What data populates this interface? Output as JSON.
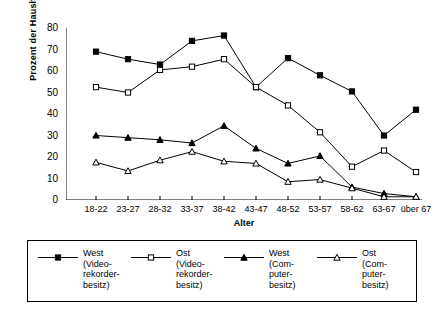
{
  "chart_data": {
    "type": "line",
    "title": "",
    "xlabel": "Alter",
    "ylabel": "Prozent der Haushalte",
    "categories": [
      "18-22",
      "23-27",
      "28-32",
      "33-37",
      "38-42",
      "43-47",
      "48-52",
      "53-57",
      "58-62",
      "63-67",
      "über 67"
    ],
    "ylim": [
      0,
      80
    ],
    "yticks": [
      0,
      10,
      20,
      30,
      40,
      50,
      60,
      70,
      80
    ],
    "grid": false,
    "legend_position": "bottom",
    "series": [
      {
        "name": "West (Videorekorderbesitz)",
        "marker": "filled-square",
        "values": [
          69,
          65.5,
          63,
          74,
          76.5,
          52.5,
          66,
          58,
          50.5,
          30,
          42
        ]
      },
      {
        "name": "Ost (Videorekorderbesitz)",
        "marker": "open-square",
        "values": [
          52.5,
          50,
          60.5,
          62,
          65.5,
          52.5,
          44,
          31.5,
          15.5,
          23,
          13
        ]
      },
      {
        "name": "West (Computerbesitz)",
        "marker": "filled-triangle",
        "values": [
          30,
          29,
          28,
          26.5,
          34.5,
          24,
          17,
          20.5,
          6,
          3,
          1.5
        ]
      },
      {
        "name": "Ost (Computerbesitz)",
        "marker": "open-triangle",
        "values": [
          17.5,
          13.5,
          18.5,
          22.5,
          18,
          17,
          8.5,
          9.5,
          5.5,
          1.5,
          1.5
        ]
      }
    ]
  },
  "axes": {
    "y_tick_labels": [
      "80",
      "70",
      "60",
      "50",
      "40",
      "30",
      "20",
      "10",
      "0"
    ],
    "y_title": "Prozent der Haushalte",
    "x_tick_labels": [
      "18-22",
      "23-27",
      "28-32",
      "33-37",
      "38-42",
      "43-47",
      "48-52",
      "53-57",
      "58-62",
      "63-67",
      "über 67"
    ],
    "x_title": "Alter"
  },
  "legend": {
    "entries": [
      {
        "marker": "filled-square",
        "lines": [
          "West",
          "(Video-",
          "rekorder-",
          "besitz)"
        ]
      },
      {
        "marker": "open-square",
        "lines": [
          "Ost",
          "(Video-",
          "rekorder-",
          "besitz)"
        ]
      },
      {
        "marker": "filled-triangle",
        "lines": [
          "West",
          "(Com-",
          "puter-",
          "besitz)"
        ]
      },
      {
        "marker": "open-triangle",
        "lines": [
          "Ost",
          "(Com-",
          "puter-",
          "besitz)"
        ]
      }
    ]
  },
  "colors": {
    "line": "#000000",
    "axis": "#000000",
    "background": "#ffffff"
  }
}
